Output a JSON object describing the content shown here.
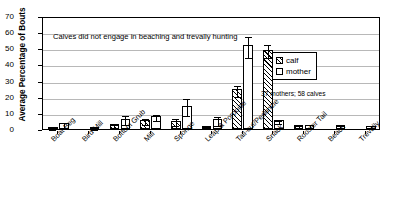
{
  "chart_data": {
    "type": "bar",
    "title": "",
    "xlabel": "",
    "ylabel": "Average Percentage of Bouts",
    "ylim": [
      0,
      70
    ],
    "yticks": [
      0,
      10,
      20,
      30,
      40,
      50,
      60,
      70
    ],
    "grid": true,
    "legend_position": "upper-right",
    "categories": [
      "Boat Beg",
      "Bird Mill",
      "Bottom Grub",
      "Mill",
      "Sponge",
      "Leap & Porpoise",
      "Tail-out/Peduncle",
      "Snack",
      "Rooster Tail",
      "Beach",
      "Trevally"
    ],
    "series": [
      {
        "name": "calf",
        "fill": "hatched",
        "values": [
          1.0,
          0.0,
          3.0,
          5.5,
          5.0,
          2.0,
          24.5,
          49.0,
          2.3,
          0.0,
          0.0
        ],
        "errors": [
          0.6,
          0.0,
          1.0,
          1.8,
          2.2,
          0.7,
          3.2,
          4.0,
          0.9,
          0.0,
          0.0
        ]
      },
      {
        "name": "mother",
        "fill": "white",
        "values": [
          3.5,
          0.8,
          6.5,
          8.0,
          14.5,
          6.0,
          52.0,
          5.5,
          2.5,
          2.5,
          2.0
        ],
        "errors": [
          1.7,
          0.3,
          2.8,
          2.0,
          5.5,
          2.6,
          6.5,
          1.0,
          1.0,
          0.9,
          0.8
        ]
      }
    ],
    "annotations": [
      "Calves did not engage in beaching and trevally hunting",
      "37 mothers; 58 calves"
    ]
  },
  "legend": {
    "items": [
      {
        "label": "calf"
      },
      {
        "label": "mother"
      }
    ]
  },
  "notes": {
    "plot_note": "Calves did not engage in beaching and trevally hunting",
    "sample_size": "37 mothers; 58 calves"
  },
  "colors": {
    "axis": "#000000",
    "grid": "#b8b8b8",
    "bar_outline": "#000000",
    "mother_fill": "#ffffff",
    "calf_fill": "#ffffff"
  }
}
